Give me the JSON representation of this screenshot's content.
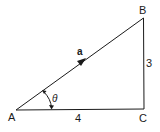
{
  "diagram": {
    "type": "right-triangle-vector",
    "vertices": {
      "A": {
        "label": "A"
      },
      "B": {
        "label": "B"
      },
      "C": {
        "label": "C"
      }
    },
    "sides": {
      "AC": {
        "label": "4"
      },
      "BC": {
        "label": "3"
      }
    },
    "vector": {
      "label": "a",
      "from": "A",
      "to": "B"
    },
    "angle": {
      "label": "θ",
      "at": "A"
    },
    "stroke_color": "#1a1a1a"
  }
}
